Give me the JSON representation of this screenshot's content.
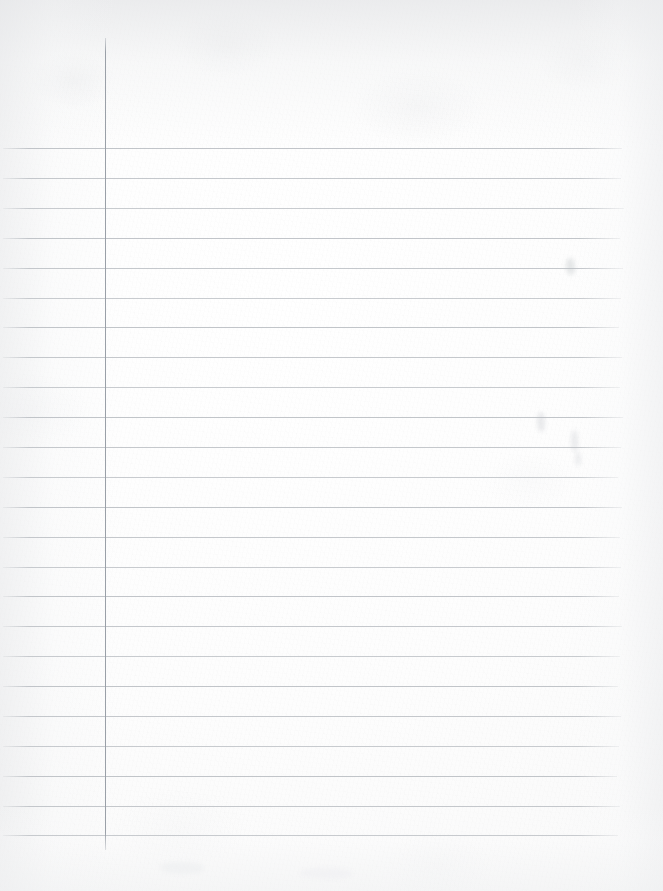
{
  "document": {
    "kind": "scanned-lined-paper",
    "description": "Blank scanned sheet of wide-ruled notebook paper",
    "page_width": 663,
    "page_height": 891,
    "written_content": "",
    "handwriting_present": "no",
    "text_lines": []
  },
  "paper": {
    "background_color": "#fdfdfd",
    "tone_warm_white": "#fafafa",
    "edge_shadow_color": "#e6e7e9",
    "texture": "scanned fibrous paper grain"
  },
  "ruling": {
    "rule_color": "#b9bdc2",
    "rule_color_light": "#c8ccd0",
    "rule_thickness_px": 1,
    "rule_spacing_px": 29.9,
    "first_rule_y": 148,
    "last_rule_y": 835,
    "rule_start_x": 3,
    "rule_end_x": 622,
    "rule_count": 24,
    "rule_y_positions": [
      148,
      178,
      208,
      238,
      268,
      298,
      327,
      357,
      387,
      417,
      447,
      477,
      507,
      537,
      567,
      596,
      626,
      656,
      686,
      716,
      746,
      776,
      806,
      835
    ],
    "rule_end_x_variation": [
      622,
      621,
      624,
      620,
      623,
      621,
      619,
      622,
      620,
      623,
      621,
      618,
      622,
      620,
      621,
      619,
      622,
      620,
      618,
      621,
      619,
      617,
      620,
      618
    ]
  },
  "margin_rule": {
    "orientation": "vertical",
    "color": "#9aa0a8",
    "thickness_px": 1,
    "x": 105,
    "top_y": 38,
    "bottom_y": 850,
    "purpose": "left margin guide"
  },
  "ghost_marks": [
    {
      "name": "bleed-mark-upper-right",
      "x": 566,
      "y": 258,
      "w": 9,
      "h": 17,
      "color": "rgba(200,203,207,0.45)"
    },
    {
      "name": "bleed-mark-mid-right",
      "x": 537,
      "y": 412,
      "w": 8,
      "h": 20,
      "color": "rgba(203,206,210,0.40)"
    },
    {
      "name": "bleed-mark-mid-right-2",
      "x": 571,
      "y": 430,
      "w": 7,
      "h": 22,
      "color": "rgba(205,208,212,0.38)"
    },
    {
      "name": "bleed-mark-center",
      "x": 575,
      "y": 452,
      "w": 6,
      "h": 14,
      "color": "rgba(206,209,213,0.34)"
    },
    {
      "name": "bleed-mark-lower-left",
      "x": 160,
      "y": 862,
      "w": 44,
      "h": 12,
      "color": "rgba(238,239,241,0.70)"
    },
    {
      "name": "bleed-mark-lower-mid",
      "x": 300,
      "y": 868,
      "w": 52,
      "h": 11,
      "color": "rgba(239,240,242,0.65)"
    }
  ]
}
